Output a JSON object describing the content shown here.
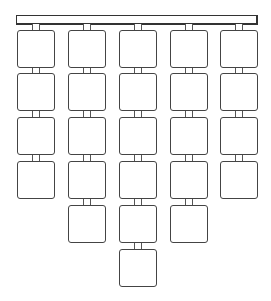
{
  "diagram": {
    "type": "hanging-grid",
    "header_bar": {
      "label": ""
    },
    "columns": [
      {
        "name": "column-1",
        "box_count": 4
      },
      {
        "name": "column-2",
        "box_count": 5
      },
      {
        "name": "column-3",
        "box_count": 6
      },
      {
        "name": "column-4",
        "box_count": 5
      },
      {
        "name": "column-5",
        "box_count": 4
      }
    ],
    "colors": {
      "stroke": "#444444",
      "fill": "#ffffff"
    }
  }
}
